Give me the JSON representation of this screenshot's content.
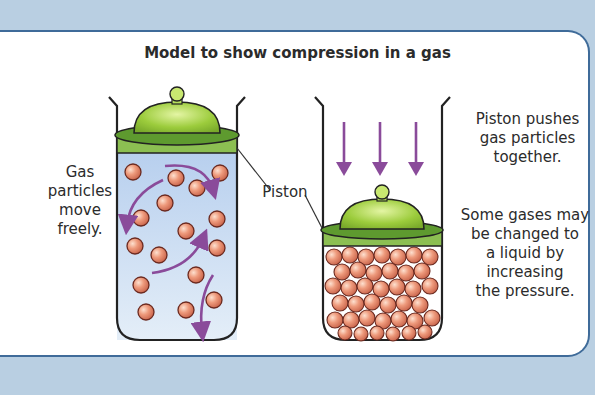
{
  "title": "Model to show compression in a gas",
  "labels": {
    "gas_left": [
      "Gas",
      "particles",
      "move",
      "freely."
    ],
    "piston": "Piston",
    "right_top": [
      "Piston pushes",
      "gas particles",
      "together."
    ],
    "right_bottom": [
      "Some gases may",
      "be changed to",
      "a liquid by",
      "increasing",
      "the pressure."
    ]
  },
  "colors": {
    "background": "#b9cfe2",
    "panel_border": "#3f6b99",
    "gas_fill": "#c7daf0",
    "piston_dome": "#9ccc3c",
    "piston_rim": "#5e9a2f",
    "particle": "#e8876a",
    "arrow": "#8a4b9a"
  }
}
